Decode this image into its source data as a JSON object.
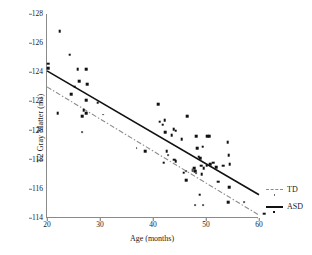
{
  "chart_data": {
    "type": "scatter",
    "title": "",
    "xlabel": "Age (months)",
    "ylabel": "T2 Gray Matter (ms)",
    "xlim": [
      20,
      60
    ],
    "ylim": [
      114,
      128
    ],
    "xticks": [
      20,
      30,
      40,
      50,
      60
    ],
    "yticks": [
      114,
      116,
      118,
      120,
      122,
      124,
      126,
      128
    ],
    "grid": false,
    "legend_position": "right",
    "legend": [
      {
        "label": "TD",
        "style": "dash-dot",
        "marker": "small-dot",
        "color": "#8d8d8d"
      },
      {
        "label": "ASD",
        "style": "solid",
        "marker": "square",
        "color": "#111111"
      }
    ],
    "series": [
      {
        "name": "ASD",
        "marker": "square",
        "color": "#111111",
        "points": [
          [
            22.4,
            126.8
          ],
          [
            24.3,
            125.2
          ],
          [
            20.2,
            124.6
          ],
          [
            20.2,
            124.3
          ],
          [
            25.8,
            124.2
          ],
          [
            27.4,
            124.2
          ],
          [
            26.1,
            123.4
          ],
          [
            27.6,
            123.2
          ],
          [
            25.2,
            123.0
          ],
          [
            24.6,
            122.5
          ],
          [
            27.4,
            122.1
          ],
          [
            29.6,
            121.9
          ],
          [
            26.9,
            121.4
          ],
          [
            27.4,
            121.2
          ],
          [
            26.6,
            121.0
          ],
          [
            22.0,
            121.2
          ],
          [
            38.5,
            118.6
          ],
          [
            41.0,
            121.8
          ],
          [
            41.3,
            120.6
          ],
          [
            42.2,
            120.7
          ],
          [
            41.8,
            120.4
          ],
          [
            42.3,
            119.9
          ],
          [
            43.9,
            120.1
          ],
          [
            43.5,
            119.7
          ],
          [
            44.3,
            120.0
          ],
          [
            42.0,
            117.8
          ],
          [
            42.6,
            118.6
          ],
          [
            44.0,
            118.0
          ],
          [
            44.3,
            117.9
          ],
          [
            45.4,
            119.4
          ],
          [
            46.5,
            121.0
          ],
          [
            45.8,
            117.1
          ],
          [
            46.3,
            116.6
          ],
          [
            47.5,
            117.3
          ],
          [
            47.8,
            117.4
          ],
          [
            48.0,
            117.2
          ],
          [
            48.3,
            118.8
          ],
          [
            48.6,
            118.2
          ],
          [
            48.9,
            118.1
          ],
          [
            48.2,
            119.6
          ],
          [
            49.1,
            117.6
          ],
          [
            49.4,
            118.9
          ],
          [
            49.2,
            117.0
          ],
          [
            49.6,
            117.4
          ],
          [
            50.2,
            119.6
          ],
          [
            50.6,
            119.6
          ],
          [
            50.1,
            117.6
          ],
          [
            50.8,
            117.7
          ],
          [
            51.4,
            117.8
          ],
          [
            51.9,
            117.5
          ],
          [
            52.3,
            116.5
          ],
          [
            53.2,
            117.6
          ],
          [
            54.1,
            119.2
          ],
          [
            54.3,
            118.3
          ],
          [
            54.5,
            117.7
          ],
          [
            54.4,
            116.1
          ],
          [
            54.2,
            115.1
          ],
          [
            48.8,
            115.6
          ],
          [
            61.0,
            114.3
          ]
        ]
      },
      {
        "name": "TD",
        "marker": "small-dot",
        "color": "#6b6b6b",
        "points": [
          [
            26.6,
            119.9
          ],
          [
            30.6,
            121.1
          ],
          [
            36.9,
            118.8
          ],
          [
            42.9,
            118.3
          ],
          [
            46.2,
            117.2
          ],
          [
            47.6,
            117.3
          ],
          [
            48.2,
            117.1
          ],
          [
            48.0,
            114.9
          ],
          [
            49.4,
            114.9
          ],
          [
            57.2,
            115.1
          ]
        ]
      }
    ],
    "fit_lines": [
      {
        "name": "ASD",
        "style": "solid",
        "color": "#111111",
        "x": [
          20,
          60
        ],
        "y": [
          124.1,
          115.6
        ]
      },
      {
        "name": "TD",
        "style": "dash-dot",
        "color": "#8d8d8d",
        "x": [
          20,
          60
        ],
        "y": [
          123.0,
          114.2
        ]
      }
    ]
  }
}
